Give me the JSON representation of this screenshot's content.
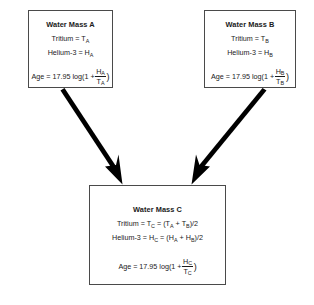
{
  "diagram": {
    "boxes": {
      "a": {
        "title": "Water Mass A",
        "tritium": "Tritium = T",
        "tritium_sub": "A",
        "helium": "Helium-3 = H",
        "helium_sub": "A",
        "age_prefix": "Age = 17.95 log(1 +",
        "age_num": "H",
        "age_num_sub": "A",
        "age_den": "T",
        "age_den_sub": "A",
        "age_suffix": ")"
      },
      "b": {
        "title": "Water Mass B",
        "tritium": "Tritium = T",
        "tritium_sub": "B",
        "helium": "Helium-3 = H",
        "helium_sub": "B",
        "age_prefix": "Age = 17.95 log(1 +",
        "age_num": "H",
        "age_num_sub": "B",
        "age_den": "T",
        "age_den_sub": "B",
        "age_suffix": ")"
      },
      "c": {
        "title": "Water Mass C",
        "tritium_p1": "Tritium = T",
        "tritium_sub1": "C",
        "tritium_p2": " = (T",
        "tritium_sub2": "A",
        "tritium_p3": " + T",
        "tritium_sub3": "B",
        "tritium_p4": ")/2",
        "helium_p1": "Helium-3 = H",
        "helium_sub1": "C",
        "helium_p2": " = (H",
        "helium_sub2": "A",
        "helium_p3": " + H",
        "helium_sub3": "B",
        "helium_p4": ")/2",
        "age_prefix": "Age = 17.95 log(1 +",
        "age_num": "H",
        "age_num_sub": "C",
        "age_den": "T",
        "age_den_sub": "C",
        "age_suffix": ")"
      }
    },
    "arrows": [
      {
        "name": "arrow-a-to-c",
        "from": "Water Mass A",
        "to": "Water Mass C"
      },
      {
        "name": "arrow-b-to-c",
        "from": "Water Mass B",
        "to": "Water Mass C"
      }
    ],
    "colors": {
      "box_border": "#4a4a4a",
      "arrow": "#000000",
      "text": "#1a1a1a",
      "background": "#ffffff"
    }
  }
}
